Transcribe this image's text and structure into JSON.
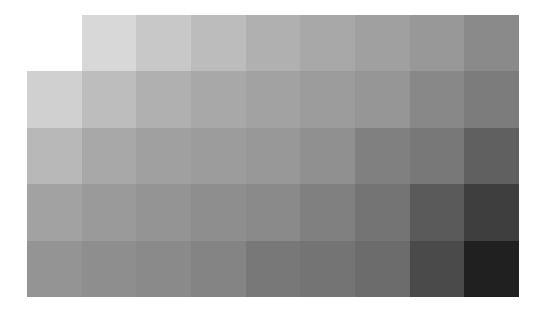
{
  "grid": {
    "left": 27,
    "top": 15,
    "cols": 9,
    "rows": 5,
    "col_width": 54.67,
    "row_height": 56.4,
    "background": "#ffffff",
    "tiles": [
      [
        null,
        "#d8d8d8",
        "#c8c8c8",
        "#bcbcbc",
        "#b0b0b0",
        "#a8a8a8",
        "#a0a0a0",
        "#989898",
        "#8a8a8a"
      ],
      [
        "#d0d0d0",
        "#bdbdbd",
        "#b0b0b0",
        "#a8a8a8",
        "#a2a2a2",
        "#9c9c9c",
        "#969696",
        "#888888",
        "#7c7c7c"
      ],
      [
        "#b8b8b8",
        "#a8a8a8",
        "#a0a0a0",
        "#9c9c9c",
        "#989898",
        "#909090",
        "#808080",
        "#787878",
        "#606060"
      ],
      [
        "#a2a2a2",
        "#9a9a9a",
        "#949494",
        "#8e8e8e",
        "#8a8a8a",
        "#808080",
        "#747474",
        "#5a5a5a",
        "#3e3e3e"
      ],
      [
        "#949494",
        "#8e8e8e",
        "#8a8a8a",
        "#848484",
        "#787878",
        "#747474",
        "#6c6c6c",
        "#4a4a4a",
        "#202020"
      ]
    ]
  }
}
